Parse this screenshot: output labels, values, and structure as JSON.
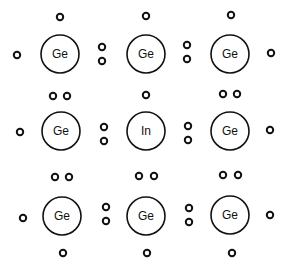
{
  "diagram": {
    "title": "",
    "colors": {
      "stroke": "#111111",
      "background": "#ffffff"
    },
    "atom_radius": 19,
    "electron_radius": 3.2,
    "atoms": [
      {
        "label": "Ge",
        "x": 60,
        "y": 54
      },
      {
        "label": "Ge",
        "x": 146,
        "y": 54
      },
      {
        "label": "Ge",
        "x": 230,
        "y": 54
      },
      {
        "label": "Ge",
        "x": 61,
        "y": 131
      },
      {
        "label": "In",
        "x": 146,
        "y": 131
      },
      {
        "label": "Ge",
        "x": 230,
        "y": 131
      },
      {
        "label": "Ge",
        "x": 62,
        "y": 216
      },
      {
        "label": "Ge",
        "x": 146,
        "y": 216
      },
      {
        "label": "Ge",
        "x": 230,
        "y": 215
      }
    ],
    "electrons": [
      {
        "x": 60,
        "y": 17
      },
      {
        "x": 146,
        "y": 16
      },
      {
        "x": 231,
        "y": 15
      },
      {
        "x": 17,
        "y": 55
      },
      {
        "x": 102,
        "y": 47
      },
      {
        "x": 102,
        "y": 61
      },
      {
        "x": 187,
        "y": 45
      },
      {
        "x": 187,
        "y": 59
      },
      {
        "x": 271,
        "y": 53
      },
      {
        "x": 53,
        "y": 96
      },
      {
        "x": 67,
        "y": 96
      },
      {
        "x": 146,
        "y": 95
      },
      {
        "x": 223,
        "y": 94
      },
      {
        "x": 237,
        "y": 94
      },
      {
        "x": 20,
        "y": 132
      },
      {
        "x": 104,
        "y": 127
      },
      {
        "x": 104,
        "y": 141
      },
      {
        "x": 188,
        "y": 126
      },
      {
        "x": 188,
        "y": 140
      },
      {
        "x": 270,
        "y": 130
      },
      {
        "x": 55,
        "y": 177
      },
      {
        "x": 69,
        "y": 177
      },
      {
        "x": 139,
        "y": 176
      },
      {
        "x": 154,
        "y": 176
      },
      {
        "x": 223,
        "y": 175
      },
      {
        "x": 238,
        "y": 175
      },
      {
        "x": 23,
        "y": 218
      },
      {
        "x": 106,
        "y": 207
      },
      {
        "x": 106,
        "y": 221
      },
      {
        "x": 189,
        "y": 208
      },
      {
        "x": 189,
        "y": 222
      },
      {
        "x": 270,
        "y": 215
      },
      {
        "x": 63,
        "y": 253
      },
      {
        "x": 147,
        "y": 253
      },
      {
        "x": 232,
        "y": 253
      }
    ]
  }
}
